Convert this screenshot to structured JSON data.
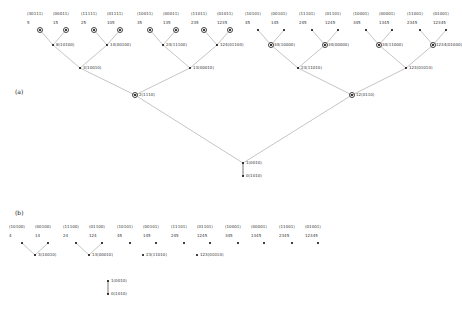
{
  "figure": {
    "panel_a_label": "(a)",
    "panel_b_label": "(b)",
    "width": 458,
    "height": 314,
    "edge_color": "#8a8a8a",
    "node_color": "#000000",
    "ring_color": "#444444"
  },
  "panel_a": {
    "leaves": [
      {
        "code": "(30111)",
        "num": "5",
        "x": 40,
        "ring": true
      },
      {
        "code": "(00011)",
        "num": "15",
        "x": 66,
        "ring": true
      },
      {
        "code": "(11111)",
        "num": "25",
        "x": 94,
        "ring": true
      },
      {
        "code": "(01111)",
        "num": "105",
        "x": 120,
        "ring": true
      },
      {
        "code": "(10011)",
        "num": "35",
        "x": 150,
        "ring": true
      },
      {
        "code": "(00011)",
        "num": "135",
        "x": 176,
        "ring": true
      },
      {
        "code": "(11011)",
        "num": "235",
        "x": 204,
        "ring": true
      },
      {
        "code": "(01011)",
        "num": "1235",
        "x": 230,
        "ring": true
      },
      {
        "code": "(10101)",
        "num": "45",
        "x": 258,
        "ring": false
      },
      {
        "code": "(00101)",
        "num": "145",
        "x": 284,
        "ring": false
      },
      {
        "code": "(11101)",
        "num": "245",
        "x": 312,
        "ring": false
      },
      {
        "code": "(01101)",
        "num": "1245",
        "x": 338,
        "ring": false
      },
      {
        "code": "(10001)",
        "num": "345",
        "x": 366,
        "ring": false
      },
      {
        "code": "(00001)",
        "num": "1345",
        "x": 392,
        "ring": false
      },
      {
        "code": "(11001)",
        "num": "2345",
        "x": 420,
        "ring": false
      },
      {
        "code": "(01001)",
        "num": "12345",
        "x": 446,
        "ring": false
      }
    ],
    "level2": [
      {
        "label": "8(10100)",
        "x": 53,
        "ring": false
      },
      {
        "label": "14(00100)",
        "x": 107,
        "ring": false
      },
      {
        "label": "24(11100)",
        "x": 163,
        "ring": false
      },
      {
        "label": "124(01100)",
        "x": 217,
        "ring": false
      },
      {
        "label": "34(10000)",
        "x": 271,
        "ring": true
      },
      {
        "label": "34(00000)",
        "x": 325,
        "ring": true
      },
      {
        "label": "34(11000)",
        "x": 379,
        "ring": true
      },
      {
        "label": "1234(01000)",
        "x": 433,
        "ring": true
      }
    ],
    "level3": [
      {
        "label": "3(10010)",
        "x": 80,
        "ring": false
      },
      {
        "label": "13(00010)",
        "x": 190,
        "ring": false
      },
      {
        "label": "23(11010)",
        "x": 298,
        "ring": false
      },
      {
        "label": "123(01010)",
        "x": 406,
        "ring": false
      }
    ],
    "level4": [
      {
        "label": "2(1110)",
        "x": 135,
        "ring": true
      },
      {
        "label": "12(0110)",
        "x": 352,
        "ring": true
      }
    ],
    "root": {
      "label": "1(0010)",
      "x": 243
    },
    "tail": {
      "label": "0(1010)",
      "x": 243
    }
  },
  "panel_b": {
    "leaves": [
      {
        "code": "(10100)",
        "num": "4",
        "x": 22
      },
      {
        "code": "(00100)",
        "num": "14",
        "x": 48
      },
      {
        "code": "(11100)",
        "num": "24",
        "x": 76
      },
      {
        "code": "(01100)",
        "num": "124",
        "x": 102
      },
      {
        "code": "(10101)",
        "num": "45",
        "x": 130
      },
      {
        "code": "(00101)",
        "num": "145",
        "x": 156
      },
      {
        "code": "(11101)",
        "num": "245",
        "x": 184
      },
      {
        "code": "(01101)",
        "num": "1245",
        "x": 210
      },
      {
        "code": "(10001)",
        "num": "345",
        "x": 238
      },
      {
        "code": "(00001)",
        "num": "1345",
        "x": 264
      },
      {
        "code": "(11001)",
        "num": "2345",
        "x": 292
      },
      {
        "code": "(01001)",
        "num": "12345",
        "x": 318
      }
    ],
    "level2": [
      {
        "label": "3(10010)",
        "x": 35
      },
      {
        "label": "13(00010)",
        "x": 89
      },
      {
        "label": "23(11010)",
        "x": 143
      },
      {
        "label": "123(01010)",
        "x": 197
      }
    ],
    "root": {
      "label": "1(0010)",
      "x": 108
    },
    "tail": {
      "label": "0(1010)",
      "x": 108
    }
  }
}
